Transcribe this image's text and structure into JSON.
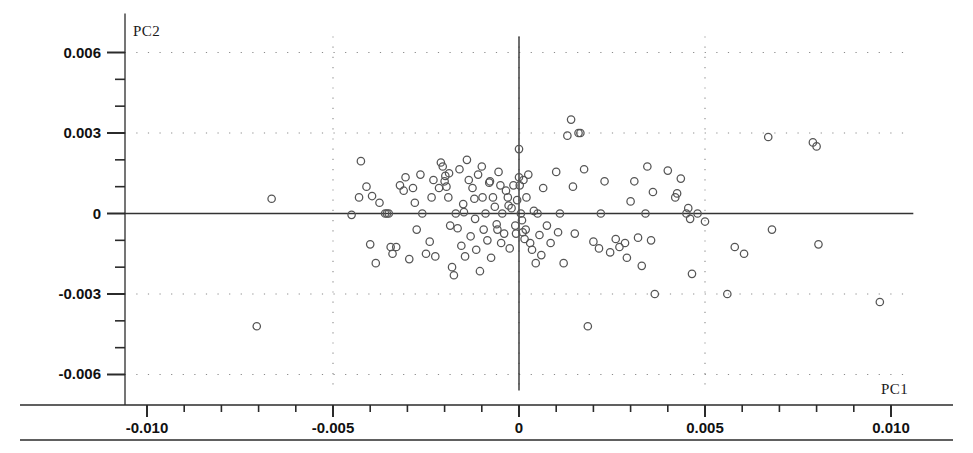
{
  "chart_data": {
    "type": "scatter",
    "title": "",
    "xlabel": "PC1",
    "ylabel": "PC2",
    "xlim": [
      -0.0106,
      0.0106
    ],
    "ylim": [
      -0.0066,
      0.0066
    ],
    "xticks": [
      -0.01,
      -0.005,
      0,
      0.005,
      0.01
    ],
    "xtick_labels": [
      "-0.010",
      "-0.005",
      "0",
      "0.005",
      "0.010"
    ],
    "yticks": [
      0.006,
      0.003,
      0,
      -0.003,
      -0.006
    ],
    "ytick_labels": [
      "0.006",
      "0.003",
      "0",
      "-0.003",
      "-0.006"
    ],
    "grid": true,
    "grid_style": "dotted",
    "gridlines_x": [
      -0.005,
      0,
      0.005
    ],
    "gridlines_y": [
      0.006,
      0.003,
      -0.003,
      -0.006
    ],
    "legend": null,
    "marker": "open-circle",
    "marker_color": "#555555",
    "axis_color": "#333333",
    "origin_axes": true,
    "n_points": 148,
    "points": [
      [
        -0.00705,
        -0.0042
      ],
      [
        -0.00665,
        0.00055
      ],
      [
        -0.0045,
        -5e-05
      ],
      [
        -0.0043,
        0.0006
      ],
      [
        -0.00425,
        0.00195
      ],
      [
        -0.0041,
        0.001
      ],
      [
        -0.004,
        -0.00115
      ],
      [
        -0.00395,
        0.00065
      ],
      [
        -0.00385,
        -0.00185
      ],
      [
        -0.00375,
        0.0004
      ],
      [
        -0.0036,
        0.0
      ],
      [
        -0.00355,
        0.0
      ],
      [
        -0.0035,
        0.0
      ],
      [
        -0.00345,
        -0.00125
      ],
      [
        -0.0034,
        -0.0015
      ],
      [
        -0.0033,
        -0.00125
      ],
      [
        -0.0032,
        0.00105
      ],
      [
        -0.0031,
        0.00085
      ],
      [
        -0.00305,
        0.00135
      ],
      [
        -0.00295,
        -0.0017
      ],
      [
        -0.00285,
        0.00095
      ],
      [
        -0.0028,
        0.0004
      ],
      [
        -0.00275,
        -0.0006
      ],
      [
        -0.00265,
        0.00145
      ],
      [
        -0.0026,
        0.0
      ],
      [
        -0.0025,
        -0.0015
      ],
      [
        -0.0024,
        -0.00105
      ],
      [
        -0.00235,
        0.0006
      ],
      [
        -0.0023,
        0.00125
      ],
      [
        -0.00225,
        -0.0016
      ],
      [
        -0.00215,
        0.00095
      ],
      [
        -0.0021,
        0.0019
      ],
      [
        -0.00205,
        0.00175
      ],
      [
        -0.002,
        0.0012
      ],
      [
        -0.00198,
        0.0014
      ],
      [
        -0.00195,
        0.001
      ],
      [
        -0.0019,
        0.0006
      ],
      [
        -0.00188,
        0.0015
      ],
      [
        -0.00185,
        -0.00045
      ],
      [
        -0.0018,
        -0.002
      ],
      [
        -0.00175,
        -0.0023
      ],
      [
        -0.0017,
        0.0
      ],
      [
        -0.00165,
        -0.00055
      ],
      [
        -0.0016,
        0.00165
      ],
      [
        -0.00155,
        -0.0012
      ],
      [
        -0.0015,
        0.00035
      ],
      [
        -0.00148,
        5e-05
      ],
      [
        -0.00145,
        -0.0016
      ],
      [
        -0.0014,
        0.002
      ],
      [
        -0.00135,
        0.00125
      ],
      [
        -0.0013,
        -0.00085
      ],
      [
        -0.00125,
        0.00095
      ],
      [
        -0.0012,
        0.00055
      ],
      [
        -0.00118,
        -0.0002
      ],
      [
        -0.00115,
        -0.00135
      ],
      [
        -0.0011,
        0.00145
      ],
      [
        -0.00105,
        -0.00215
      ],
      [
        -0.001,
        0.00175
      ],
      [
        -0.00098,
        0.0006
      ],
      [
        -0.00095,
        -0.0006
      ],
      [
        -0.0009,
        0.0
      ],
      [
        -0.00085,
        -0.001
      ],
      [
        -0.0008,
        0.00115
      ],
      [
        -0.00078,
        0.0012
      ],
      [
        -0.00075,
        -0.00165
      ],
      [
        -0.0007,
        0.0006
      ],
      [
        -0.00065,
        0.00025
      ],
      [
        -0.0006,
        -0.0004
      ],
      [
        -0.00058,
        -0.0006
      ],
      [
        -0.00055,
        0.00155
      ],
      [
        -0.0005,
        0.00105
      ],
      [
        -0.00048,
        -0.0011
      ],
      [
        -0.00045,
        0.0
      ],
      [
        -0.0004,
        -0.00075
      ],
      [
        -0.00035,
        0.00085
      ],
      [
        -0.0003,
        0.0006
      ],
      [
        -0.00028,
        0.0003
      ],
      [
        -0.00025,
        -0.0013
      ],
      [
        -0.0002,
        0.0002
      ],
      [
        -0.00015,
        0.00105
      ],
      [
        -0.0001,
        -0.00045
      ],
      [
        -8e-05,
        -0.00075
      ],
      [
        -5e-05,
        0.0005
      ],
      [
        0.0,
        0.0024
      ],
      [
        0.0,
        0.00135
      ],
      [
        2e-05,
        0.00105
      ],
      [
        5e-05,
        0.0
      ],
      [
        8e-05,
        -0.00025
      ],
      [
        0.0001,
        -0.0007
      ],
      [
        0.00012,
        0.00125
      ],
      [
        0.00015,
        -0.00095
      ],
      [
        0.00018,
        -0.0006
      ],
      [
        0.0002,
        0.0006
      ],
      [
        0.00025,
        0.00145
      ],
      [
        0.0003,
        -0.0011
      ],
      [
        0.00035,
        -0.00135
      ],
      [
        0.0004,
        0.0001
      ],
      [
        0.00045,
        -0.00185
      ],
      [
        0.0005,
        0.0
      ],
      [
        0.00055,
        -0.0008
      ],
      [
        0.0006,
        -0.00155
      ],
      [
        0.00065,
        0.00095
      ],
      [
        0.00075,
        -0.00045
      ],
      [
        0.00085,
        -0.0011
      ],
      [
        0.001,
        0.00155
      ],
      [
        0.00105,
        -0.0007
      ],
      [
        0.0011,
        0.0
      ],
      [
        0.0012,
        -0.00185
      ],
      [
        0.0013,
        0.0029
      ],
      [
        0.0014,
        0.0035
      ],
      [
        0.00145,
        0.001
      ],
      [
        0.0015,
        -0.00075
      ],
      [
        0.0016,
        0.003
      ],
      [
        0.00165,
        0.003
      ],
      [
        0.00175,
        0.00165
      ],
      [
        0.00185,
        -0.0042
      ],
      [
        0.002,
        -0.00105
      ],
      [
        0.00215,
        -0.0013
      ],
      [
        0.0022,
        0.0
      ],
      [
        0.0023,
        0.0012
      ],
      [
        0.00245,
        -0.00145
      ],
      [
        0.0026,
        -0.00095
      ],
      [
        0.0027,
        -0.00125
      ],
      [
        0.00285,
        -0.0011
      ],
      [
        0.0029,
        -0.00165
      ],
      [
        0.003,
        0.00045
      ],
      [
        0.0031,
        0.0012
      ],
      [
        0.0032,
        -0.0009
      ],
      [
        0.0033,
        -0.00195
      ],
      [
        0.0034,
        0.0
      ],
      [
        0.00345,
        0.00175
      ],
      [
        0.00355,
        -0.001
      ],
      [
        0.0036,
        0.0008
      ],
      [
        0.00365,
        -0.003
      ],
      [
        0.004,
        0.0016
      ],
      [
        0.0042,
        0.0006
      ],
      [
        0.00425,
        0.00075
      ],
      [
        0.00435,
        0.0013
      ],
      [
        0.0045,
        0.0
      ],
      [
        0.00455,
        0.0002
      ],
      [
        0.0046,
        -0.0002
      ],
      [
        0.00465,
        -0.00225
      ],
      [
        0.0048,
        0.0
      ],
      [
        0.005,
        -0.0003
      ],
      [
        0.0056,
        -0.003
      ],
      [
        0.0058,
        -0.00125
      ],
      [
        0.00605,
        -0.0015
      ],
      [
        0.0067,
        0.00285
      ],
      [
        0.0068,
        -0.0006
      ],
      [
        0.0079,
        0.00265
      ],
      [
        0.008,
        0.0025
      ],
      [
        0.00805,
        -0.00115
      ],
      [
        0.0097,
        -0.0033
      ]
    ]
  },
  "axis_names": {
    "x": "PC1",
    "y": "PC2"
  }
}
